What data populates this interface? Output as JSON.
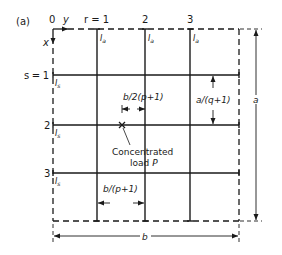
{
  "figure": {
    "panel_label": "(a)",
    "origin_label": "0",
    "y_axis_label": "y",
    "x_axis_label": "x",
    "column_labels": [
      "r = 1",
      "2",
      "3"
    ],
    "row_labels": [
      "s = 1",
      "2",
      "3"
    ],
    "column_beam_label": "I",
    "column_beam_subscript": "a",
    "row_beam_label": "I",
    "row_beam_subscript": "s",
    "load_label_line1": "Concentrated",
    "load_label_line2": "load",
    "load_symbol": "P",
    "dim_half_spacing": "b/2(p+1)",
    "dim_col_spacing": "b/(p+1)",
    "dim_row_spacing": "a/(q+1)",
    "dim_height": "a",
    "dim_width": "b"
  },
  "colors": {
    "line": "#1a1a1a",
    "background": "#ffffff"
  }
}
